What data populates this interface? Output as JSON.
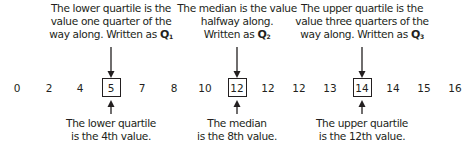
{
  "values": [
    "0",
    "2",
    "4",
    "5",
    "7",
    "8",
    "10",
    "12",
    "12",
    "12",
    "13",
    "14",
    "14",
    "15",
    "16"
  ],
  "annotations": {
    "q1": {
      "top_line1": "The lower quartile is the",
      "top_line2": "value one quarter of the",
      "top_line3": "way along. Written as",
      "symbol": "Q",
      "subscript": "1",
      "bottom_line1": "The lower quartile",
      "bottom_line2": "is the 4th value.",
      "highlighted_value": "5"
    },
    "q2": {
      "top_line1": "The median is the value",
      "top_line2": "halfway along.",
      "top_line3": "Written as",
      "symbol": "Q",
      "subscript": "2",
      "bottom_line1": "The median",
      "bottom_line2": "is the 8th value.",
      "highlighted_value": "12"
    },
    "q3": {
      "top_line1": "The upper quartile is the",
      "top_line2": "value three quarters of the",
      "top_line3": "way along. Written as",
      "symbol": "Q",
      "subscript": "3",
      "bottom_line1": "The upper quartile",
      "bottom_line2": "is the 12th value.",
      "highlighted_value": "14"
    }
  },
  "colors": {
    "text": "#231f20",
    "background": "#ffffff"
  }
}
